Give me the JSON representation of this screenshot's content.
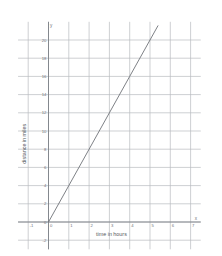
{
  "chart_data": {
    "type": "line",
    "title": "",
    "xlabel": "time in hours",
    "ylabel": "distance in miles",
    "x_axis_letter": "x",
    "y_axis_letter": "y",
    "xlim": [
      -1.5,
      7.5
    ],
    "ylim": [
      -3,
      22
    ],
    "xticks": [
      -1,
      0,
      1,
      2,
      3,
      4,
      5,
      6,
      7
    ],
    "xtick_labels": [
      "-1",
      "0",
      "1",
      "2",
      "3",
      "4",
      "5",
      "6",
      "7"
    ],
    "yticks": [
      -2,
      0,
      2,
      4,
      6,
      8,
      10,
      12,
      14,
      16,
      18,
      20
    ],
    "ytick_labels": [
      "-2",
      "0",
      "2",
      "4",
      "6",
      "8",
      "10",
      "12",
      "14",
      "16",
      "18",
      "20"
    ],
    "grid": true,
    "grid_color": "#b9bcc0",
    "axis_color": "#7c8086",
    "line_color": "#6f7378",
    "legend": "none",
    "series": [
      {
        "name": "distance",
        "slope": 4,
        "intercept": 0,
        "x": [
          0,
          1,
          2,
          3,
          4,
          5,
          5.4
        ],
        "values": [
          0,
          4,
          8,
          12,
          16,
          20,
          21.6
        ]
      }
    ]
  }
}
